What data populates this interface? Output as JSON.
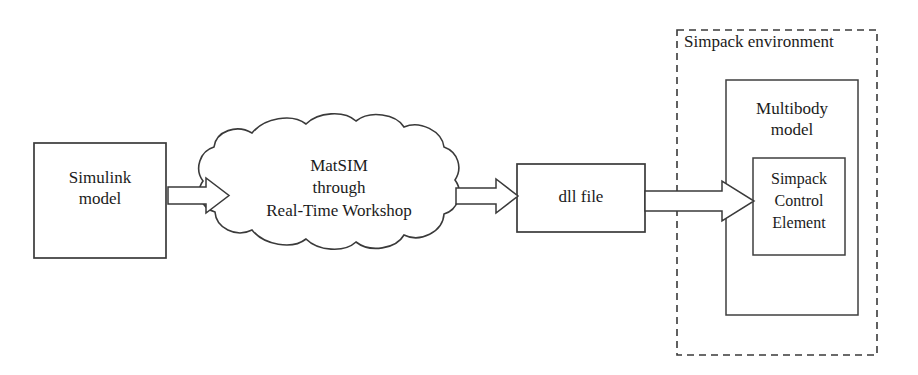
{
  "diagram": {
    "background_color": "#ffffff",
    "stroke_color": "#3a3a3a",
    "text_color": "#1b1b1b",
    "nodes": {
      "simulink": {
        "label": "Simulink\nmodel",
        "shape": "rectangle"
      },
      "matsim_cloud": {
        "label": "MatSIM\nthrough\nReal-Time Workshop",
        "shape": "cloud"
      },
      "dll": {
        "label": "dll file",
        "shape": "rectangle"
      },
      "environment": {
        "label": "Simpack environment",
        "shape": "dashed-rectangle"
      },
      "multibody": {
        "label": "Multibody\nmodel",
        "shape": "rectangle"
      },
      "control_element": {
        "label": "Simpack\nControl\nElement",
        "shape": "rectangle"
      }
    },
    "arrows": [
      {
        "name": "arrow-simulink-to-matsim",
        "from": "simulink",
        "to": "matsim_cloud",
        "style": "hollow-block-arrow",
        "direction": "right"
      },
      {
        "name": "arrow-matsim-to-dll",
        "from": "matsim_cloud",
        "to": "dll",
        "style": "hollow-block-arrow",
        "direction": "right"
      },
      {
        "name": "arrow-dll-to-control-element",
        "from": "dll",
        "to": "control_element",
        "style": "hollow-block-arrow",
        "direction": "right"
      }
    ]
  }
}
